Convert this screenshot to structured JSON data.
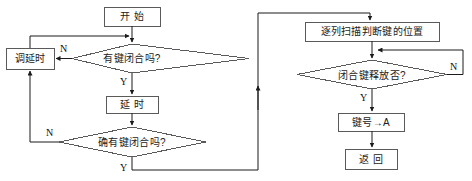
{
  "diagram": {
    "stroke_color": "#5a5a5a",
    "text_color": "#1b1b1b",
    "background": "#ffffff"
  },
  "nodes": {
    "start": {
      "label": "开  始",
      "shape": "process"
    },
    "key_closed_check": {
      "label": "有键闭合吗?",
      "shape": "decision"
    },
    "debounce_delay": {
      "label": "调延时",
      "shape": "process"
    },
    "delay": {
      "label": "延   时",
      "shape": "process"
    },
    "confirm_key_closed": {
      "label": "确有键闭合吗?",
      "shape": "decision"
    },
    "column_scan": {
      "label": "逐列扫描判断键的位置",
      "shape": "process"
    },
    "key_released_check": {
      "label": "闭合键释放否?",
      "shape": "decision"
    },
    "key_to_a": {
      "label": "键号→A",
      "shape": "process"
    },
    "return": {
      "label": "返  回",
      "shape": "process"
    }
  },
  "branch_labels": {
    "key_closed_no": "N",
    "key_closed_yes": "Y",
    "confirm_no": "N",
    "confirm_yes": "Y",
    "released_no": "N",
    "released_yes": "Y"
  }
}
